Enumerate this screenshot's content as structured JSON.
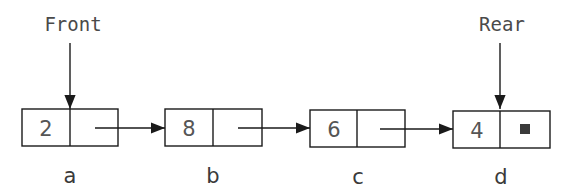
{
  "diagram": {
    "type": "linked-queue",
    "pointers": {
      "front": {
        "label": "Front",
        "points_to": "a"
      },
      "rear": {
        "label": "Rear",
        "points_to": "d"
      }
    },
    "nodes": [
      {
        "name": "a",
        "value": "2",
        "next": "b"
      },
      {
        "name": "b",
        "value": "8",
        "next": "c"
      },
      {
        "name": "c",
        "value": "6",
        "next": "d"
      },
      {
        "name": "d",
        "value": "4",
        "next": null,
        "null_marker": "■"
      }
    ],
    "colors": {
      "line": "#1a1a1a",
      "text": "#4a4a4a",
      "null_marker": "#3a3a3a"
    }
  }
}
